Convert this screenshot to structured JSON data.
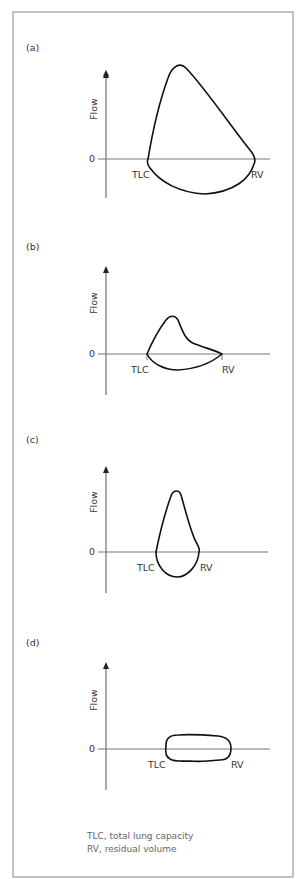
{
  "figure": {
    "panels": [
      {
        "id": "a",
        "label": "(a)",
        "y_axis_label": "Flow",
        "zero_label": "0",
        "left_marker": "TLC",
        "right_marker": "RV",
        "shape": "normal"
      },
      {
        "id": "b",
        "label": "(b)",
        "y_axis_label": "Flow",
        "zero_label": "0",
        "left_marker": "TLC",
        "right_marker": "RV",
        "shape": "obstructive"
      },
      {
        "id": "c",
        "label": "(c)",
        "y_axis_label": "Flow",
        "zero_label": "0",
        "left_marker": "TLC",
        "right_marker": "RV",
        "shape": "restrictive"
      },
      {
        "id": "d",
        "label": "(d)",
        "y_axis_label": "Flow",
        "zero_label": "0",
        "left_marker": "TLC",
        "right_marker": "RV",
        "shape": "fixed-upper-airway-obstruction"
      }
    ],
    "caption": {
      "line1": "TLC, total lung capacity",
      "line2": "RV, residual volume"
    },
    "colors": {
      "frame": "#9a9a9a",
      "loop": "#111111",
      "axis": "#555555",
      "caption": "#666666"
    }
  }
}
